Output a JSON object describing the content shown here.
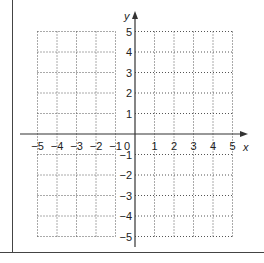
{
  "diagram": {
    "type": "coordinate-grid",
    "x_axis": {
      "label": "x",
      "min": -5,
      "max": 5,
      "ticks": [
        "-5",
        "-4",
        "-3",
        "-2",
        "-1",
        "0",
        "1",
        "2",
        "3",
        "4",
        "5"
      ]
    },
    "y_axis": {
      "label": "y",
      "min": -5,
      "max": 5,
      "ticks": [
        "5",
        "4",
        "3",
        "2",
        "1",
        "-1",
        "-2",
        "-3",
        "-4",
        "-5"
      ]
    },
    "grid": {
      "style": "dotted",
      "cells_x": 10,
      "cells_y": 10
    },
    "colors": {
      "axis": "#333333",
      "grid": "#555555",
      "frame": "#444444",
      "text": "#222222"
    }
  }
}
